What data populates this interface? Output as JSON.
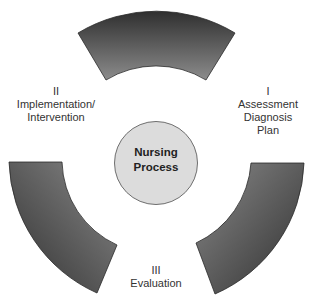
{
  "diagram": {
    "type": "cycle",
    "center": {
      "lines": [
        "Nursing",
        "Process"
      ],
      "fill": "#dcdcdc",
      "stroke": "#777777"
    },
    "segment_fill_dark": "#3a3a3a",
    "segment_fill_light": "#8a8a8a",
    "stages": [
      {
        "numeral": "I",
        "lines": [
          "Assessment",
          "Diagnosis",
          "Plan"
        ]
      },
      {
        "numeral": "II",
        "lines": [
          "Implementation/",
          "Intervention"
        ]
      },
      {
        "numeral": "III",
        "lines": [
          "Evaluation"
        ]
      }
    ]
  }
}
